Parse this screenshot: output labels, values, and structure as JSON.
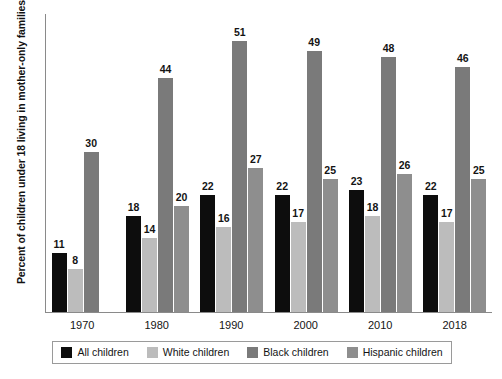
{
  "chart_data": {
    "type": "bar",
    "title": "",
    "xlabel": "",
    "ylabel": "Percent of children under 18 living in mother-only families",
    "ylim": [
      0,
      56
    ],
    "grid": false,
    "legend_position": "bottom",
    "categories": [
      "1970",
      "1980",
      "1990",
      "2000",
      "2010",
      "2018"
    ],
    "series": [
      {
        "name": "All children",
        "color": "#0d0d0d",
        "values": [
          11,
          18,
          22,
          22,
          23,
          22
        ]
      },
      {
        "name": "White children",
        "color": "#bcbcbc",
        "values": [
          8,
          14,
          16,
          17,
          18,
          17
        ]
      },
      {
        "name": "Black children",
        "color": "#7a7a7a",
        "values": [
          30,
          44,
          51,
          49,
          48,
          46
        ]
      },
      {
        "name": "Hispanic children",
        "color": "#8e8e8e",
        "values": [
          null,
          20,
          27,
          25,
          26,
          25
        ]
      }
    ]
  },
  "legend": {
    "items": [
      {
        "label": "All children",
        "swatch_class": "c-all"
      },
      {
        "label": "White children",
        "swatch_class": "c-white"
      },
      {
        "label": "Black children",
        "swatch_class": "c-black"
      },
      {
        "label": "Hispanic children",
        "swatch_class": "c-hisp"
      }
    ]
  }
}
